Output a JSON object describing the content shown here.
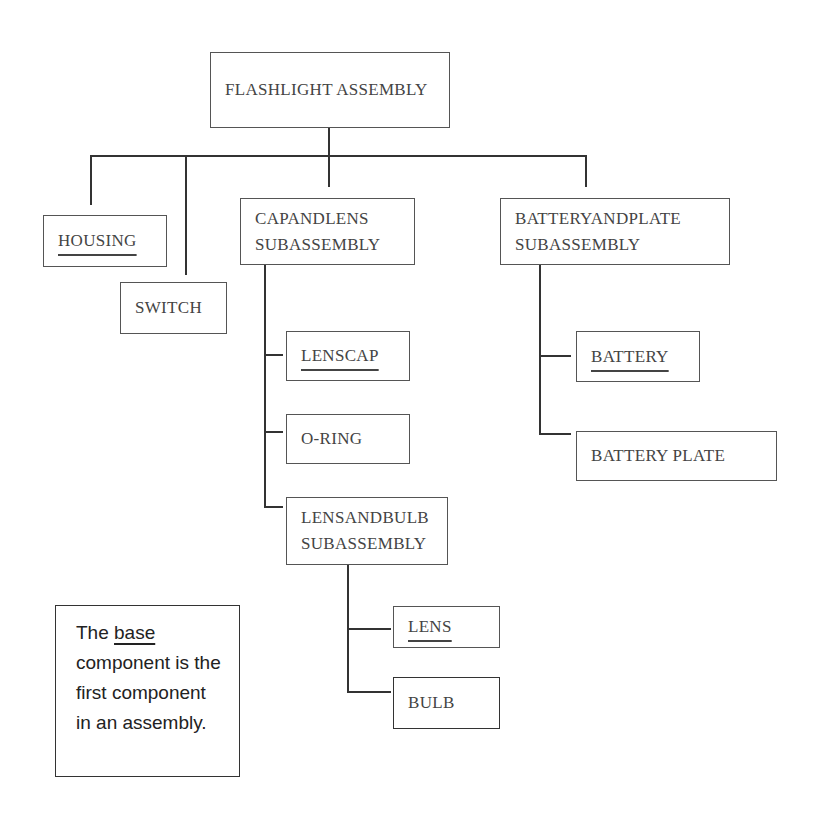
{
  "diagram": {
    "root": {
      "label": "FLASHLIGHT ASSEMBLY"
    },
    "nodes": {
      "housing": {
        "label": "HOUSING",
        "base": true
      },
      "switch": {
        "label": "SWITCH",
        "base": false
      },
      "cap_and_lens": {
        "line1": "CAPANDLENS",
        "line2": "SUBASSEMBLY"
      },
      "battery_and_plate": {
        "line1": "BATTERYANDPLATE",
        "line2": "SUBASSEMBLY"
      },
      "lens_cap": {
        "label": "LENSCAP",
        "base": true
      },
      "o_ring": {
        "label": "O-RING",
        "base": false
      },
      "lens_and_bulb": {
        "line1": "LENSANDBULB",
        "line2": "SUBASSEMBLY"
      },
      "lens": {
        "label": "LENS",
        "base": true
      },
      "bulb": {
        "label": "BULB",
        "base": false
      },
      "battery": {
        "label": "BATTERY",
        "base": true
      },
      "battery_plate": {
        "label": "BATTERY PLATE",
        "base": false
      }
    },
    "note": {
      "prefix": "The ",
      "keyword": "base",
      "rest": "component is the first component in an assembly."
    }
  }
}
